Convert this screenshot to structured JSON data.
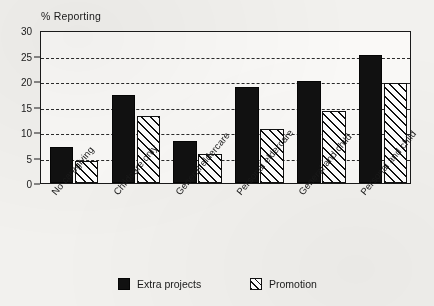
{
  "chart_data": {
    "type": "bar",
    "title": "",
    "ylabel": "% Reporting",
    "xlabel": "",
    "ylim": [
      0,
      30
    ],
    "yticks": [
      0,
      5,
      10,
      15,
      20,
      25,
      30
    ],
    "grid": true,
    "grid_style": "dashed-horizontal",
    "legend_position": "bottom",
    "categories": [
      "No caregiving",
      "Childcare only",
      "General eldercare",
      "Personal eldercare",
      "General and child",
      "Personal and child"
    ],
    "series": [
      {
        "name": "Extra projects",
        "fill": "solid-black",
        "color": "#111111",
        "values": [
          7.0,
          17.3,
          8.3,
          18.8,
          20.0,
          25.1
        ]
      },
      {
        "name": "Promotion",
        "fill": "diagonal-hatch",
        "color": "#111111",
        "values": [
          4.3,
          13.2,
          5.7,
          10.6,
          14.1,
          19.6
        ]
      }
    ]
  },
  "axis": {
    "y_title": "% Reporting",
    "tick_labels": [
      "0",
      "5",
      "10",
      "15",
      "20",
      "25",
      "30"
    ]
  },
  "legend": {
    "items": [
      {
        "label": "Extra projects",
        "swatch": "solid-swatch-icon"
      },
      {
        "label": "Promotion",
        "swatch": "hatch-swatch-icon"
      }
    ]
  },
  "colors": {
    "ink": "#111111",
    "paper": "#f2f1ee",
    "plot_background": "#faf9f7"
  }
}
